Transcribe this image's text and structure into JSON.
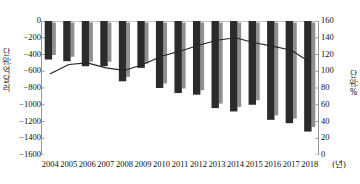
{
  "chart_data": {
    "type": "bar",
    "title": "",
    "subtitle": "",
    "xlabel": "(년)",
    "ylabel": "단위: 억 달러",
    "y2label": "단위: %",
    "grid": false,
    "legend": "none",
    "categories": [
      "2004",
      "2005",
      "2006",
      "2007",
      "2008",
      "2009",
      "2010",
      "2011",
      "2012",
      "2013",
      "2014",
      "2015",
      "2016",
      "2017",
      "2018"
    ],
    "ylim": [
      -1600,
      0
    ],
    "y2lim": [
      0,
      160
    ],
    "yticks": [
      0,
      -200,
      -400,
      -600,
      -800,
      -1000,
      -1200,
      -1400,
      -1600
    ],
    "ytick_labels": [
      "0",
      "−200",
      "−400",
      "−600",
      "−800",
      "−1000",
      "−1200",
      "−1400",
      "−1600"
    ],
    "y2ticks": [
      0,
      20,
      40,
      60,
      80,
      100,
      120,
      140,
      160
    ],
    "y2tick_labels": [
      "0",
      "20",
      "40",
      "60",
      "80",
      "100",
      "120",
      "140",
      "160"
    ],
    "series": [
      {
        "name": "막대그래프",
        "type": "bar",
        "axis": "left",
        "unit": "억 달러",
        "values": [
          -460,
          -480,
          -540,
          -540,
          -720,
          -560,
          -800,
          -860,
          -880,
          -1040,
          -1080,
          -1000,
          -1180,
          -1220,
          -1320
        ]
      },
      {
        "name": "선그래프",
        "type": "line",
        "axis": "right",
        "unit": "%",
        "values": [
          97,
          108,
          110,
          104,
          101,
          108,
          118,
          124,
          131,
          137,
          140,
          134,
          130,
          125,
          111
        ]
      }
    ]
  },
  "axis": {
    "left_title": "단위: 억 달러",
    "right_title": "단위: %",
    "x_unit_label": "(년)"
  },
  "colors": {
    "bar_front": "#2b2b2b",
    "bar_side": "#8f8f8f",
    "line": "#262626",
    "axis": "#8a8a8a",
    "text": "#111111",
    "background": "#ffffff"
  }
}
